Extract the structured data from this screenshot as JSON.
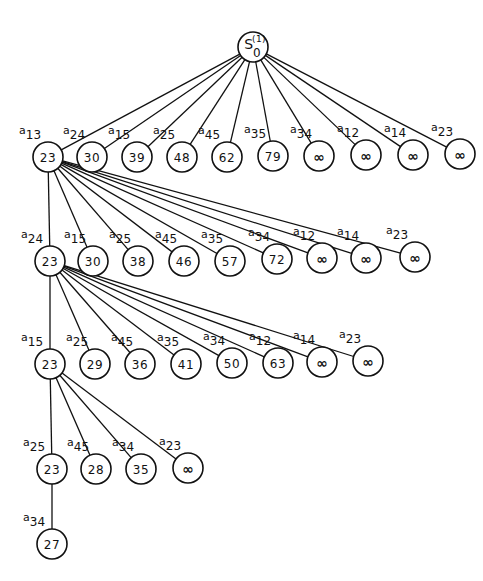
{
  "diagram": {
    "type": "search-tree",
    "colors": {
      "stroke": "#111111",
      "background": "#ffffff"
    },
    "root": {
      "id": "root",
      "label": "S",
      "superscript": "(1)",
      "subscript": "0",
      "x": 253,
      "y": 47,
      "r": 15
    },
    "levels": [
      {
        "parent": "root",
        "nodes": [
          {
            "id": "L1-0",
            "value": "23",
            "edge": "13",
            "x": 48,
            "y": 157
          },
          {
            "id": "L1-1",
            "value": "30",
            "edge": "24",
            "x": 92,
            "y": 157
          },
          {
            "id": "L1-2",
            "value": "39",
            "edge": "15",
            "x": 137,
            "y": 157
          },
          {
            "id": "L1-3",
            "value": "48",
            "edge": "25",
            "x": 182,
            "y": 157
          },
          {
            "id": "L1-4",
            "value": "62",
            "edge": "45",
            "x": 227,
            "y": 157
          },
          {
            "id": "L1-5",
            "value": "79",
            "edge": "35",
            "x": 273,
            "y": 156
          },
          {
            "id": "L1-6",
            "value": "∞",
            "edge": "34",
            "x": 319,
            "y": 156
          },
          {
            "id": "L1-7",
            "value": "∞",
            "edge": "12",
            "x": 366,
            "y": 155
          },
          {
            "id": "L1-8",
            "value": "∞",
            "edge": "14",
            "x": 413,
            "y": 155
          },
          {
            "id": "L1-9",
            "value": "∞",
            "edge": "23",
            "x": 460,
            "y": 154
          }
        ]
      },
      {
        "parent": "L1-0",
        "nodes": [
          {
            "id": "L2-0",
            "value": "23",
            "edge": "24",
            "x": 50,
            "y": 261
          },
          {
            "id": "L2-1",
            "value": "30",
            "edge": "15",
            "x": 93,
            "y": 261
          },
          {
            "id": "L2-2",
            "value": "38",
            "edge": "25",
            "x": 138,
            "y": 261
          },
          {
            "id": "L2-3",
            "value": "46",
            "edge": "45",
            "x": 184,
            "y": 261
          },
          {
            "id": "L2-4",
            "value": "57",
            "edge": "35",
            "x": 230,
            "y": 261
          },
          {
            "id": "L2-5",
            "value": "72",
            "edge": "34",
            "x": 277,
            "y": 259
          },
          {
            "id": "L2-6",
            "value": "∞",
            "edge": "12",
            "x": 322,
            "y": 258
          },
          {
            "id": "L2-7",
            "value": "∞",
            "edge": "14",
            "x": 366,
            "y": 258
          },
          {
            "id": "L2-8",
            "value": "∞",
            "edge": "23",
            "x": 415,
            "y": 257
          }
        ]
      },
      {
        "parent": "L2-0",
        "nodes": [
          {
            "id": "L3-0",
            "value": "23",
            "edge": "15",
            "x": 50,
            "y": 364
          },
          {
            "id": "L3-1",
            "value": "29",
            "edge": "25",
            "x": 95,
            "y": 364
          },
          {
            "id": "L3-2",
            "value": "36",
            "edge": "45",
            "x": 140,
            "y": 364
          },
          {
            "id": "L3-3",
            "value": "41",
            "edge": "35",
            "x": 186,
            "y": 364
          },
          {
            "id": "L3-4",
            "value": "50",
            "edge": "34",
            "x": 232,
            "y": 363
          },
          {
            "id": "L3-5",
            "value": "63",
            "edge": "12",
            "x": 278,
            "y": 363
          },
          {
            "id": "L3-6",
            "value": "∞",
            "edge": "14",
            "x": 322,
            "y": 362
          },
          {
            "id": "L3-7",
            "value": "∞",
            "edge": "23",
            "x": 368,
            "y": 361
          }
        ]
      },
      {
        "parent": "L3-0",
        "nodes": [
          {
            "id": "L4-0",
            "value": "23",
            "edge": "25",
            "x": 52,
            "y": 469
          },
          {
            "id": "L4-1",
            "value": "28",
            "edge": "45",
            "x": 96,
            "y": 469
          },
          {
            "id": "L4-2",
            "value": "35",
            "edge": "34",
            "x": 141,
            "y": 469
          },
          {
            "id": "L4-3",
            "value": "∞",
            "edge": "23",
            "x": 188,
            "y": 468
          }
        ]
      },
      {
        "parent": "L4-0",
        "nodes": [
          {
            "id": "L5-0",
            "value": "27",
            "edge": "34",
            "x": 52,
            "y": 544
          }
        ]
      }
    ],
    "edge_prefix": "a",
    "node_radius": 15
  }
}
